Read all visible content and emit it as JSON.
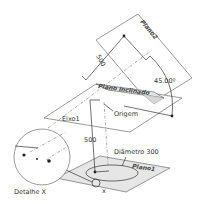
{
  "diagram": {
    "planes": [
      {
        "id": "plano2",
        "label": "Plano2"
      },
      {
        "id": "plano-inclinado",
        "label": "Plano inclinado"
      },
      {
        "id": "plano1",
        "label": "Plano1"
      }
    ],
    "labels": {
      "dim_upper": "500",
      "angle": "45.00º",
      "axis": "Eixo1",
      "origin": "Origem",
      "dim_lower": "500",
      "diameter": "Diâmetro 300",
      "detail": "Detalhe X",
      "x_marker": "x"
    }
  }
}
